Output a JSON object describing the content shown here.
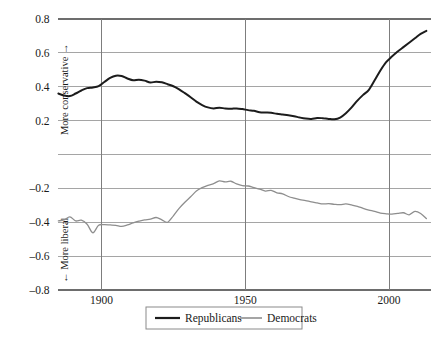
{
  "chart_data": {
    "type": "line",
    "title": "",
    "subtitle": "",
    "xlabel": "",
    "ylabel": "",
    "xlim": [
      1884.7,
      2014.6
    ],
    "ylim": [
      -0.8,
      0.8
    ],
    "grid": true,
    "grid_x": true,
    "grid_y": true,
    "xticks": [
      1900,
      1950,
      2000
    ],
    "xtick_labels": [
      "1900",
      "1950",
      "2000"
    ],
    "yticks": [
      0.8,
      0.6,
      0.4,
      0.2,
      0.0,
      -0.2,
      -0.4,
      -0.6,
      -0.8
    ],
    "ytick_labels": [
      "0.8",
      "0.6",
      "0.4",
      "0.2",
      "",
      "–0.2",
      "–0.4",
      "–0.6",
      "–0.8"
    ],
    "annotations": [
      {
        "name": "upper-axis-caption",
        "text": "More conservative →",
        "orientation": "vertical",
        "value_range": [
          0.15,
          0.62
        ]
      },
      {
        "name": "lower-axis-caption",
        "text": "← More liberal",
        "orientation": "vertical",
        "value_range": [
          -0.78,
          -0.35
        ]
      }
    ],
    "legend": {
      "position": "bottom-center",
      "entries": [
        {
          "name": "Republicans",
          "color": "#1c1c1c",
          "width": 2.0
        },
        {
          "name": "Democrats",
          "color": "#8e8e8e",
          "width": 1.4
        }
      ]
    },
    "series": [
      {
        "name": "Republicans",
        "color": "#1c1c1c",
        "x": [
          1885,
          1887,
          1889,
          1891,
          1893,
          1895,
          1897,
          1899,
          1901,
          1903,
          1905,
          1907,
          1909,
          1911,
          1913,
          1915,
          1917,
          1919,
          1921,
          1923,
          1925,
          1927,
          1929,
          1931,
          1933,
          1935,
          1937,
          1939,
          1941,
          1943,
          1945,
          1947,
          1949,
          1951,
          1953,
          1955,
          1957,
          1959,
          1961,
          1963,
          1965,
          1967,
          1969,
          1971,
          1973,
          1975,
          1977,
          1979,
          1981,
          1983,
          1985,
          1987,
          1989,
          1991,
          1993,
          1995,
          1997,
          1999,
          2001,
          2003,
          2005,
          2007,
          2009,
          2011,
          2013
        ],
        "y": [
          0.36,
          0.348,
          0.345,
          0.36,
          0.378,
          0.392,
          0.396,
          0.404,
          0.428,
          0.452,
          0.465,
          0.463,
          0.449,
          0.438,
          0.442,
          0.436,
          0.425,
          0.43,
          0.426,
          0.415,
          0.403,
          0.385,
          0.362,
          0.338,
          0.312,
          0.292,
          0.278,
          0.272,
          0.276,
          0.272,
          0.27,
          0.272,
          0.268,
          0.262,
          0.258,
          0.25,
          0.248,
          0.246,
          0.24,
          0.236,
          0.232,
          0.226,
          0.218,
          0.212,
          0.21,
          0.216,
          0.214,
          0.21,
          0.208,
          0.218,
          0.244,
          0.278,
          0.318,
          0.352,
          0.382,
          0.438,
          0.496,
          0.545,
          0.578,
          0.608,
          0.634,
          0.66,
          0.686,
          0.712,
          0.73
        ]
      },
      {
        "name": "Democrats",
        "color": "#8e8e8e",
        "x": [
          1885,
          1887,
          1889,
          1891,
          1893,
          1895,
          1897,
          1899,
          1901,
          1903,
          1905,
          1907,
          1909,
          1911,
          1913,
          1915,
          1917,
          1919,
          1921,
          1923,
          1925,
          1927,
          1929,
          1931,
          1933,
          1935,
          1937,
          1939,
          1941,
          1943,
          1945,
          1947,
          1949,
          1951,
          1953,
          1955,
          1957,
          1959,
          1961,
          1963,
          1965,
          1967,
          1969,
          1971,
          1973,
          1975,
          1977,
          1979,
          1981,
          1983,
          1985,
          1987,
          1989,
          1991,
          1993,
          1995,
          1997,
          1999,
          2001,
          2003,
          2005,
          2007,
          2009,
          2011,
          2013
        ],
        "y": [
          -0.392,
          -0.386,
          -0.368,
          -0.392,
          -0.388,
          -0.412,
          -0.462,
          -0.418,
          -0.414,
          -0.416,
          -0.418,
          -0.424,
          -0.416,
          -0.404,
          -0.394,
          -0.386,
          -0.382,
          -0.372,
          -0.386,
          -0.4,
          -0.362,
          -0.318,
          -0.282,
          -0.25,
          -0.216,
          -0.196,
          -0.182,
          -0.172,
          -0.156,
          -0.162,
          -0.158,
          -0.174,
          -0.184,
          -0.186,
          -0.196,
          -0.204,
          -0.216,
          -0.212,
          -0.226,
          -0.232,
          -0.248,
          -0.258,
          -0.266,
          -0.272,
          -0.28,
          -0.286,
          -0.292,
          -0.29,
          -0.294,
          -0.296,
          -0.292,
          -0.298,
          -0.306,
          -0.318,
          -0.328,
          -0.336,
          -0.346,
          -0.35,
          -0.352,
          -0.348,
          -0.344,
          -0.356,
          -0.336,
          -0.348,
          -0.378
        ]
      }
    ]
  },
  "axes": {
    "left_label_upper": "More conservative →",
    "left_label_lower": "← More liberal"
  },
  "legend": {
    "republicans_label": "Republicans",
    "democrats_label": "Democrats"
  },
  "style": {
    "republican_color": "#1c1c1c",
    "democrat_color": "#8e8e8e",
    "grid_color": "#9b9b9b",
    "legend_border_color": "#8a8a8a",
    "background": "#ffffff"
  }
}
